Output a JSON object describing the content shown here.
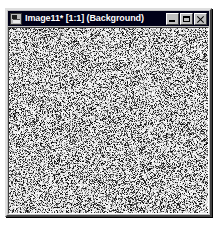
{
  "window": {
    "title": "Image11* [1:1] (Background)",
    "document_name": "Image11",
    "modified_marker": "*",
    "zoom_level": "1:1",
    "layer_name": "Background",
    "icon": "image-document-icon",
    "titlebar_color": "#000018",
    "titlebar_text_color": "#ffffff",
    "frame_color": "#c0c0c0",
    "desktop_color": "#ffffff"
  },
  "caption_buttons": [
    {
      "name": "minimize",
      "label": "Minimize",
      "glyph": "minimize-icon"
    },
    {
      "name": "maximize",
      "label": "Maximize",
      "glyph": "maximize-icon"
    },
    {
      "name": "close",
      "label": "Close",
      "glyph": "close-icon"
    }
  ],
  "canvas": {
    "name": "image-canvas",
    "content_description": "random monochrome noise",
    "width_px": 203,
    "height_px": 190,
    "background_color": "#ffffff",
    "noise_color": "#000000",
    "noise_density": 0.5,
    "border_color": "#808080"
  }
}
